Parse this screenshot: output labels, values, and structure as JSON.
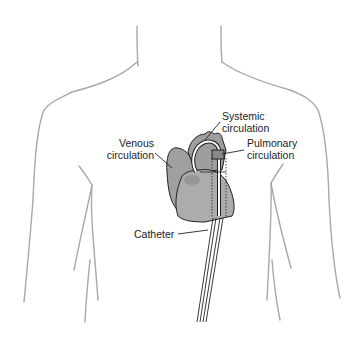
{
  "diagram": {
    "labels": {
      "systemic": {
        "line1": "Systemic",
        "line2": "circulation"
      },
      "venous": {
        "line1": "Venous",
        "line2": "circulation"
      },
      "pulmonary": {
        "line1": "Pulmonary",
        "line2": "circulation"
      },
      "catheter": "Catheter"
    },
    "colors": {
      "body_outline": "#a8a8a8",
      "heart_fill": "#a9a9a9",
      "heart_stroke": "#222222",
      "text": "#222222",
      "background": "#ffffff"
    }
  }
}
